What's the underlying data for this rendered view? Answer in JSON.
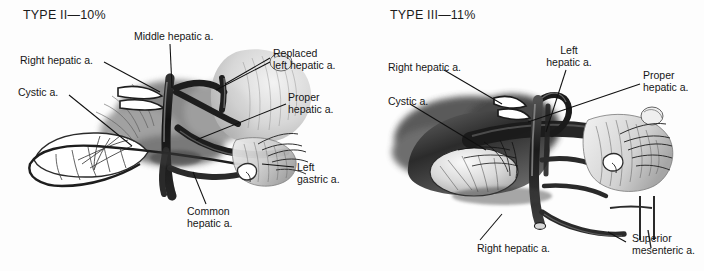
{
  "figure": {
    "kind": "anatomical-illustration",
    "background_color": "#fdfdfd",
    "ink_color": "#161616"
  },
  "panels": [
    {
      "id": "type-2",
      "title": "TYPE II—10%",
      "labels": [
        {
          "name": "right-hepatic-artery",
          "line1": "Right hepatic a.",
          "line2": ""
        },
        {
          "name": "cystic-artery",
          "line1": "Cystic a.",
          "line2": ""
        },
        {
          "name": "middle-hepatic-artery",
          "line1": "Middle hepatic a.",
          "line2": ""
        },
        {
          "name": "replaced-left-hepatic-artery",
          "line1": "Replaced",
          "line2": "left hepatic a."
        },
        {
          "name": "proper-hepatic-artery",
          "line1": "Proper",
          "line2": "hepatic a."
        },
        {
          "name": "left-gastric-artery",
          "line1": "Left",
          "line2": "gastric a."
        },
        {
          "name": "common-hepatic-artery",
          "line1": "Common",
          "line2": "hepatic a."
        }
      ]
    },
    {
      "id": "type-3",
      "title": "TYPE III—11%",
      "labels": [
        {
          "name": "right-hepatic-artery",
          "line1": "Right hepatic a.",
          "line2": ""
        },
        {
          "name": "cystic-artery",
          "line1": "Cystic a.",
          "line2": ""
        },
        {
          "name": "left-hepatic-artery",
          "line1": "Left",
          "line2": "hepatic a."
        },
        {
          "name": "proper-hepatic-artery",
          "line1": "Proper",
          "line2": "hepatic a."
        },
        {
          "name": "replaced-right-hepatic-artery",
          "line1": "Right hepatic a.",
          "line2": ""
        },
        {
          "name": "superior-mesenteric-artery",
          "line1": "Superior",
          "line2": "mesenteric a."
        }
      ]
    }
  ]
}
